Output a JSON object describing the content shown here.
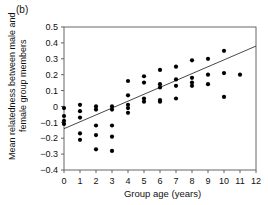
{
  "panel": {
    "label": "(b)"
  },
  "chart_data": {
    "type": "scatter",
    "title": "",
    "xlabel": "Group age (years)",
    "ylabel": "Mean relatedness between male and female group members",
    "xlim": [
      0,
      12
    ],
    "ylim": [
      -0.4,
      0.5
    ],
    "xticks": [
      "0",
      "1",
      "2",
      "3",
      "4",
      "5",
      "6",
      "7",
      "8",
      "9",
      "10",
      "11",
      "12"
    ],
    "xtick_values": [
      0,
      1,
      2,
      3,
      4,
      5,
      6,
      7,
      8,
      9,
      10,
      11,
      12
    ],
    "yticks": [
      "0.5",
      "0.4",
      "0.3",
      "0.2",
      "0.1",
      "0",
      "−0.1",
      "−0.2",
      "−0.3",
      "−0.4"
    ],
    "ytick_values": [
      0.5,
      0.4,
      0.3,
      0.2,
      0.1,
      0,
      -0.1,
      -0.2,
      -0.3,
      -0.4
    ],
    "grid": false,
    "legend": null,
    "marker": "filled-circle",
    "marker_color": "#000000",
    "line_color": "#333333",
    "axis_color": "#666666",
    "points": [
      [
        0,
        -0.01
      ],
      [
        0,
        -0.06
      ],
      [
        0,
        -0.09
      ],
      [
        0,
        -0.11
      ],
      [
        1,
        0.01
      ],
      [
        1,
        -0.03
      ],
      [
        1,
        -0.07
      ],
      [
        1,
        -0.17
      ],
      [
        1,
        -0.21
      ],
      [
        2,
        0.0
      ],
      [
        2,
        -0.02
      ],
      [
        2,
        -0.12
      ],
      [
        2,
        -0.18
      ],
      [
        2,
        -0.27
      ],
      [
        3,
        0.0
      ],
      [
        3,
        -0.02
      ],
      [
        3,
        -0.12
      ],
      [
        3,
        -0.19
      ],
      [
        3,
        -0.28
      ],
      [
        4,
        0.16
      ],
      [
        4,
        0.07
      ],
      [
        4,
        0.01
      ],
      [
        4,
        -0.01
      ],
      [
        4,
        -0.04
      ],
      [
        5,
        0.19
      ],
      [
        5,
        0.15
      ],
      [
        5,
        0.05
      ],
      [
        5,
        0.03
      ],
      [
        6,
        0.23
      ],
      [
        6,
        0.14
      ],
      [
        6,
        0.12
      ],
      [
        6,
        0.04
      ],
      [
        6,
        0.03
      ],
      [
        7,
        0.25
      ],
      [
        7,
        0.17
      ],
      [
        7,
        0.13
      ],
      [
        7,
        0.05
      ],
      [
        8,
        0.29
      ],
      [
        8,
        0.18
      ],
      [
        8,
        0.15
      ],
      [
        8,
        0.13
      ],
      [
        9,
        0.3
      ],
      [
        9,
        0.2
      ],
      [
        9,
        0.14
      ],
      [
        10,
        0.35
      ],
      [
        10,
        0.21
      ],
      [
        10,
        0.06
      ],
      [
        11,
        0.2
      ]
    ],
    "trendline": {
      "x0": 0,
      "y0": -0.14,
      "x1": 12,
      "y1": 0.38
    }
  }
}
